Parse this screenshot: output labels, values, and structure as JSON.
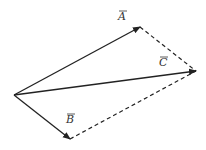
{
  "diagram": {
    "colors": {
      "background": "#ffffff",
      "stroke": "#222222",
      "label": "#333333"
    },
    "origin": {
      "x": 14,
      "y": 95
    },
    "vectors": [
      {
        "id": "A",
        "label": "A",
        "tip": {
          "x": 140,
          "y": 27
        },
        "style": "solid",
        "label_pos": {
          "x": 118,
          "y": 20
        }
      },
      {
        "id": "B",
        "label": "B",
        "tip": {
          "x": 70,
          "y": 139
        },
        "style": "solid",
        "label_pos": {
          "x": 66,
          "y": 123
        }
      },
      {
        "id": "C",
        "label": "C",
        "tip": {
          "x": 196,
          "y": 71
        },
        "style": "solid",
        "label_pos": {
          "x": 159,
          "y": 66
        }
      }
    ],
    "dashed_edges": [
      {
        "from": "A",
        "to": "C",
        "x1": 140,
        "y1": 27,
        "x2": 196,
        "y2": 71
      },
      {
        "from": "B",
        "to": "C",
        "x1": 70,
        "y1": 139,
        "x2": 196,
        "y2": 71
      }
    ]
  }
}
